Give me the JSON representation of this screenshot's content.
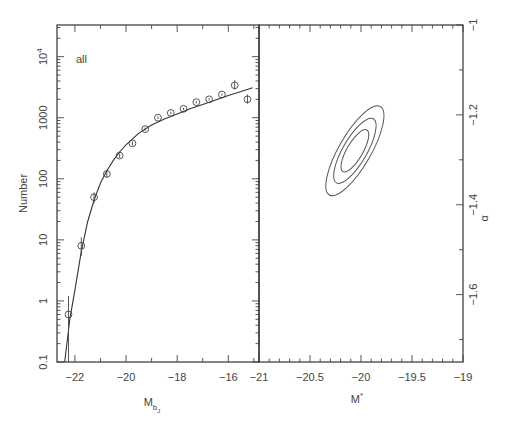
{
  "chart_data": [
    {
      "type": "scatter",
      "panel": "left",
      "title": "",
      "annotation": "all",
      "xlabel": "M",
      "xlabel_sub": "bJ",
      "ylabel": "Number",
      "yscale": "log",
      "xlim": [
        -22.7,
        -14.8
      ],
      "ylim": [
        0.1,
        33000
      ],
      "xticks": [
        -22,
        -20,
        -18,
        -16
      ],
      "xtick_labels": [
        "−22",
        "−20",
        "−18",
        "−16"
      ],
      "yticks": [
        0.1,
        1,
        10,
        100,
        1000,
        10000
      ],
      "ytick_labels": [
        "0.1",
        "1",
        "10",
        "100",
        "1000",
        "10⁴"
      ],
      "series": [
        {
          "name": "data",
          "style": "open-circle-with-error-bars",
          "x": [
            -22.25,
            -21.75,
            -21.25,
            -20.75,
            -20.25,
            -19.75,
            -19.25,
            -18.75,
            -18.25,
            -17.75,
            -17.25,
            -16.75,
            -16.25,
            -15.75,
            -15.25
          ],
          "y": [
            0.6,
            8,
            50,
            120,
            240,
            380,
            650,
            1000,
            1200,
            1400,
            1800,
            2000,
            2400,
            3400,
            2000
          ],
          "yerr_up": [
            1.2,
            11,
            60,
            135,
            260,
            410,
            690,
            1050,
            1260,
            1460,
            1880,
            2090,
            2500,
            4100,
            2400
          ],
          "yerr_down": [
            0.05,
            5.5,
            40,
            105,
            220,
            350,
            610,
            950,
            1140,
            1340,
            1720,
            1910,
            2300,
            2900,
            1700
          ]
        },
        {
          "name": "Schechter fit",
          "style": "line",
          "x": [
            -22.4,
            -22.2,
            -22.0,
            -21.75,
            -21.5,
            -21.25,
            -21.0,
            -20.75,
            -20.5,
            -20.25,
            -20.0,
            -19.5,
            -19.0,
            -18.5,
            -18.0,
            -17.5,
            -17.0,
            -16.5,
            -16.0,
            -15.5,
            -15.05
          ],
          "y": [
            0.1,
            0.5,
            1.5,
            6.5,
            20,
            45,
            85,
            135,
            200,
            275,
            360,
            560,
            760,
            950,
            1150,
            1400,
            1650,
            1950,
            2300,
            2700,
            3100
          ]
        }
      ]
    },
    {
      "type": "contour",
      "panel": "right",
      "title": "",
      "xlabel": "M*",
      "ylabel": "α",
      "xlim": [
        -21,
        -19
      ],
      "ylim": [
        -1.75,
        -1.0
      ],
      "xticks": [
        -21,
        -20.5,
        -20,
        -19.5,
        -19
      ],
      "xtick_labels": [
        "−21",
        "−20.5",
        "−20",
        "−19.5",
        "−19"
      ],
      "yticks": [
        -1.0,
        -1.2,
        -1.4,
        -1.6
      ],
      "ytick_labels": [
        "−1",
        "−1.2",
        "−1.4",
        "−1.6"
      ],
      "yaxis_side": "right",
      "center": {
        "Mstar": -20.06,
        "alpha": -1.28
      },
      "contours": [
        {
          "level": "1σ",
          "half_major_px": 24,
          "half_minor_px": 8,
          "angle_deg": -60
        },
        {
          "level": "2σ",
          "half_major_px": 37,
          "half_minor_px": 12,
          "angle_deg": -60
        },
        {
          "level": "3σ",
          "half_major_px": 51,
          "half_minor_px": 16,
          "angle_deg": -60
        }
      ]
    }
  ]
}
